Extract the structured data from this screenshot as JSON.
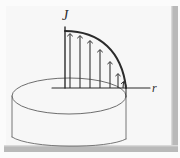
{
  "figure": {
    "kind": "scanned-textbook-diagram",
    "background_color": "#ffffff",
    "paper_color": "#f7f7f7",
    "ink_color": "#2b2b2b",
    "ink_light_color": "#6e6e6e",
    "frame_color": "#b8b8b8",
    "frame_shadow_color": "#d6d6d6",
    "labels": {
      "vertical_axis": "J",
      "horizontal_axis": "r"
    },
    "axes": {
      "origin": {
        "x": 65,
        "y": 88
      },
      "vertical_axis_top": {
        "x": 65,
        "y": 27
      },
      "horizontal_axis_end": {
        "x": 150,
        "y": 88
      }
    },
    "ellipse": {
      "center_x": 69,
      "center_y": 96,
      "radius_x": 57,
      "radius_y": 18
    },
    "cylinder_walls": [
      {
        "x": 12,
        "y_top": 96,
        "y_bottom": 137
      },
      {
        "x": 126,
        "y_top": 96,
        "y_bottom": 137
      }
    ],
    "curve": {
      "type": "decaying-profile",
      "start": {
        "x": 65,
        "y": 31
      },
      "end": {
        "x": 126,
        "y": 88
      },
      "control_1": {
        "x": 100,
        "y": 31
      },
      "control_2": {
        "x": 122,
        "y": 52
      }
    },
    "arrows": [
      {
        "x": 70,
        "y_base": 88,
        "y_tip": 33
      },
      {
        "x": 80,
        "y_base": 88,
        "y_tip": 35
      },
      {
        "x": 90,
        "y_base": 88,
        "y_tip": 40
      },
      {
        "x": 100,
        "y_base": 88,
        "y_tip": 49
      },
      {
        "x": 110,
        "y_base": 88,
        "y_tip": 61
      },
      {
        "x": 118,
        "y_base": 88,
        "y_tip": 73
      },
      {
        "x": 124,
        "y_base": 88,
        "y_tip": 83
      }
    ],
    "frame": {
      "right_bar_x": 172,
      "right_bar_y": 6,
      "right_bar_width": 6,
      "right_bar_height": 146,
      "bottom_bar_x": 4,
      "bottom_bar_y": 146,
      "bottom_bar_width": 174,
      "bottom_bar_height": 6
    }
  }
}
